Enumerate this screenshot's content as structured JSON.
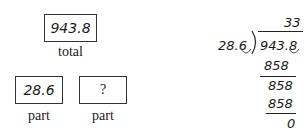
{
  "bar_model": {
    "total": {
      "value": "943.8",
      "label": "total"
    },
    "parts": [
      {
        "value": "28.6",
        "label": "part"
      },
      {
        "value": "?",
        "label": "part"
      }
    ]
  },
  "long_division": {
    "quotient": "33",
    "divisor": "28.6",
    "dividend": "943.8",
    "steps": [
      "858",
      "858",
      "858",
      "0"
    ]
  }
}
